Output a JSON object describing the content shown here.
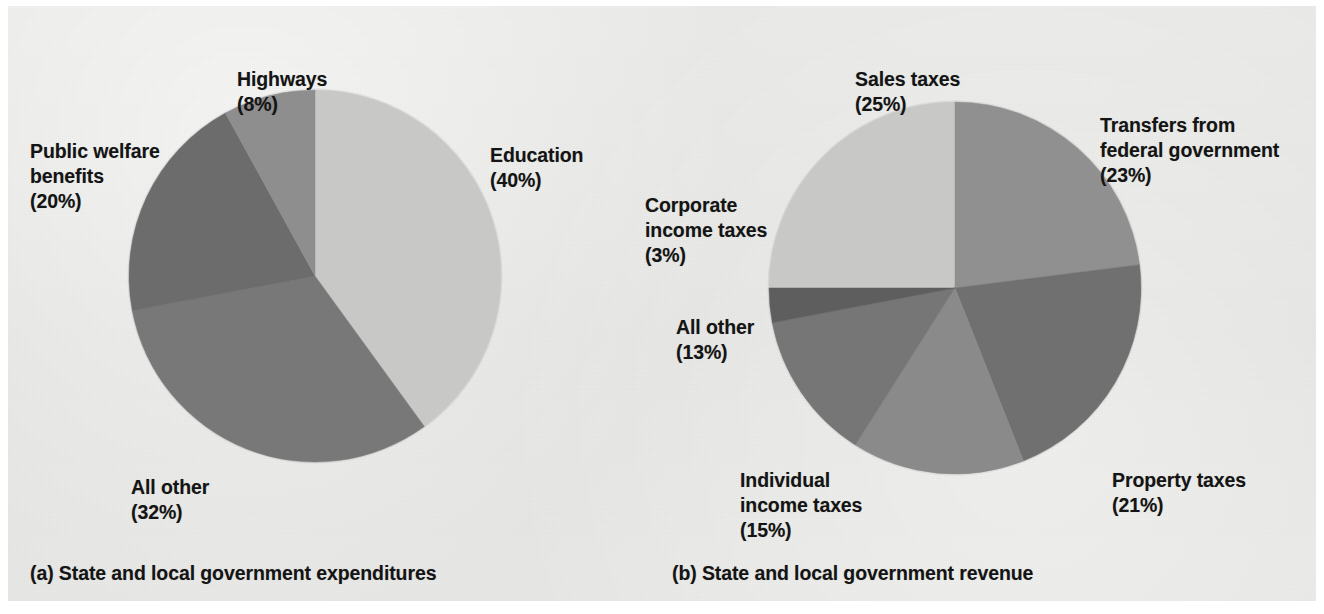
{
  "figure": {
    "background_color": "#e7e7e5",
    "page_color": "#ffffff",
    "text_color": "#141414"
  },
  "panels": [
    {
      "id": "a",
      "caption": "(a) State and local government expenditures",
      "center": {
        "x": 315,
        "y": 276
      },
      "radius": 186,
      "start_angle_deg": 0
    },
    {
      "id": "b",
      "caption": "(b) State and local government revenue",
      "center": {
        "x": 955,
        "y": 288
      },
      "radius": 186,
      "start_angle_deg": -90
    }
  ],
  "labels": {
    "a": {
      "education": {
        "name": "Education",
        "pct": "(40%)"
      },
      "all_other": {
        "name": "All other",
        "pct": "(32%)"
      },
      "public_welfare": {
        "name": "Public welfare\nbenefits",
        "pct": "(20%)"
      },
      "highways": {
        "name": "Highways",
        "pct": "(8%)"
      }
    },
    "b": {
      "sales_taxes": {
        "name": "Sales taxes",
        "pct": "(25%)"
      },
      "transfers": {
        "name": "Transfers from\nfederal government",
        "pct": "(23%)"
      },
      "property_taxes": {
        "name": "Property taxes",
        "pct": "(21%)"
      },
      "individual_income": {
        "name": "Individual\nincome taxes",
        "pct": "(15%)"
      },
      "all_other": {
        "name": "All other",
        "pct": "(13%)"
      },
      "corporate_income": {
        "name": "Corporate\nincome taxes",
        "pct": "(3%)"
      }
    }
  },
  "chart_data": [
    {
      "type": "pie",
      "id": "a",
      "title": "(a) State and local government expenditures",
      "unit": "percent",
      "start_angle_deg": 0,
      "direction": "clockwise",
      "legend": "labels-outside",
      "categories": [
        "Education",
        "All other",
        "Public welfare benefits",
        "Highways"
      ],
      "values": [
        40,
        32,
        20,
        8
      ],
      "labels": [
        "Education (40%)",
        "All other (32%)",
        "Public welfare benefits (20%)",
        "Highways (8%)"
      ],
      "colors": [
        "#c8c8c6",
        "#787878",
        "#6c6c6c",
        "#8e8e8e"
      ]
    },
    {
      "type": "pie",
      "id": "b",
      "title": "(b) State and local government revenue",
      "unit": "percent",
      "start_angle_deg": -90,
      "direction": "clockwise",
      "legend": "labels-outside",
      "categories": [
        "Sales taxes",
        "Transfers from federal government",
        "Property taxes",
        "Individual income taxes",
        "All other",
        "Corporate income taxes"
      ],
      "values": [
        25,
        23,
        21,
        15,
        13,
        3
      ],
      "labels": [
        "Sales taxes (25%)",
        "Transfers from federal government (23%)",
        "Property taxes (21%)",
        "Individual income taxes (15%)",
        "All other (13%)",
        "Corporate income taxes (3%)"
      ],
      "colors": [
        "#c8c8c6",
        "#909090",
        "#707070",
        "#8a8a8a",
        "#767676",
        "#5e5e5e"
      ]
    }
  ]
}
